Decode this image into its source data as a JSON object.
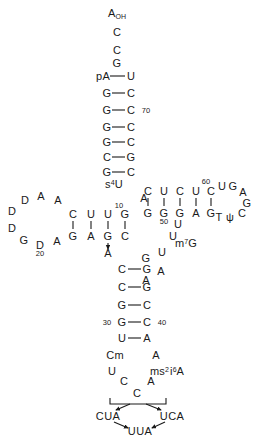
{
  "diagram": {
    "ink_color": "#1a1a1a",
    "background": "#ffffff"
  },
  "acceptor_stem": {
    "three_prime_end": {
      "label": "A",
      "sub": "OH",
      "x": 117,
      "y": 14
    },
    "five_prime_end": {
      "label": "pA",
      "x": 103,
      "y": 76
    },
    "single_strand_3p": [
      {
        "label": "C",
        "x": 117,
        "y": 32
      },
      {
        "label": "C",
        "x": 117,
        "y": 50
      },
      {
        "label": "G",
        "x": 117,
        "y": 63
      }
    ],
    "pairs": [
      {
        "left": "pA",
        "right": "U",
        "lx": 103,
        "rx": 131,
        "y": 76,
        "number": null
      },
      {
        "left": "G",
        "right": "C",
        "lx": 107,
        "rx": 131,
        "y": 93,
        "number": null
      },
      {
        "left": "G",
        "right": "C",
        "lx": 107,
        "rx": 131,
        "y": 110,
        "number": "70",
        "num_x": 146,
        "num_y": 111
      },
      {
        "left": "G",
        "right": "C",
        "lx": 107,
        "rx": 131,
        "y": 127,
        "number": null
      },
      {
        "left": "G",
        "right": "C",
        "lx": 107,
        "rx": 131,
        "y": 142,
        "number": null
      },
      {
        "left": "C",
        "right": "G",
        "lx": 107,
        "rx": 131,
        "y": 157,
        "number": null
      },
      {
        "left": "G",
        "right": "C",
        "lx": 107,
        "rx": 131,
        "y": 172,
        "number": null
      }
    ]
  },
  "t_arm": {
    "top_strand": [
      {
        "label": "C",
        "x": 148,
        "y": 191
      },
      {
        "label": "U",
        "x": 164,
        "y": 191
      },
      {
        "label": "C",
        "x": 180,
        "y": 191
      },
      {
        "label": "U",
        "x": 196,
        "y": 191
      },
      {
        "label": "C",
        "x": 211,
        "y": 191,
        "number": "60",
        "num_x": 206,
        "num_y": 182
      }
    ],
    "bottom_strand": [
      {
        "label": "G",
        "x": 148,
        "y": 213
      },
      {
        "label": "G",
        "x": 164,
        "y": 213,
        "number": "50",
        "num_x": 164,
        "num_y": 222
      },
      {
        "label": "G",
        "x": 180,
        "y": 213
      },
      {
        "label": "A",
        "x": 196,
        "y": 213
      },
      {
        "label": "G",
        "x": 211,
        "y": 213
      }
    ],
    "loop": [
      {
        "label": "U",
        "x": 222,
        "y": 186
      },
      {
        "label": "G",
        "x": 233,
        "y": 186
      },
      {
        "label": "A",
        "x": 243,
        "y": 192
      },
      {
        "label": "G",
        "x": 247,
        "y": 203
      },
      {
        "label": "C",
        "x": 242,
        "y": 213
      },
      {
        "label": "ψ",
        "x": 230,
        "y": 217
      },
      {
        "label": "T",
        "x": 219,
        "y": 217
      }
    ]
  },
  "d_arm": {
    "top_strand": [
      {
        "label": "C",
        "x": 73,
        "y": 214
      },
      {
        "label": "U",
        "x": 91,
        "y": 214
      },
      {
        "label": "U",
        "x": 108,
        "y": 214
      },
      {
        "label": "G",
        "x": 125,
        "y": 214,
        "number": "10",
        "num_x": 119,
        "num_y": 206
      }
    ],
    "bottom_strand": [
      {
        "label": "G",
        "x": 73,
        "y": 236
      },
      {
        "label": "A",
        "x": 91,
        "y": 236
      },
      {
        "label": "G",
        "x": 108,
        "y": 236
      },
      {
        "label": "C",
        "x": 125,
        "y": 236
      }
    ],
    "loop": [
      {
        "label": "A",
        "x": 58,
        "y": 200
      },
      {
        "label": "A",
        "x": 41,
        "y": 196
      },
      {
        "label": "D",
        "x": 25,
        "y": 200
      },
      {
        "label": "D",
        "x": 12,
        "y": 211
      },
      {
        "label": "D",
        "x": 12,
        "y": 228
      },
      {
        "label": "G",
        "x": 24,
        "y": 240
      },
      {
        "label": "D",
        "x": 40,
        "y": 245,
        "number": "20",
        "num_x": 40,
        "num_y": 254
      },
      {
        "label": "A",
        "x": 57,
        "y": 241
      }
    ]
  },
  "modified_bases": [
    {
      "label": "s",
      "sup": "4",
      "tail": "U",
      "x": 114,
      "y": 184,
      "name": "s4U"
    },
    {
      "label": "A",
      "x": 108,
      "y": 253,
      "name": "A-bulge"
    }
  ],
  "variable_loop": [
    {
      "label": "A",
      "x": 144,
      "y": 198
    },
    {
      "label": "U",
      "x": 178,
      "y": 224
    },
    {
      "label": "U",
      "x": 173,
      "y": 236
    },
    {
      "label": "m",
      "sup": "7",
      "tail": "G",
      "x": 184,
      "y": 243,
      "name": "m7G"
    },
    {
      "label": "U",
      "x": 162,
      "y": 252
    },
    {
      "label": "G",
      "x": 146,
      "y": 258
    },
    {
      "label": "A",
      "x": 161,
      "y": 271
    },
    {
      "label": "A",
      "x": 146,
      "y": 280
    }
  ],
  "anticodon_stem": {
    "pairs": [
      {
        "left": "C",
        "right": "G",
        "lx": 122,
        "rx": 147,
        "y": 269
      },
      {
        "left": "C",
        "right": "G",
        "lx": 122,
        "rx": 147,
        "y": 287
      },
      {
        "left": "G",
        "right": "C",
        "lx": 122,
        "rx": 147,
        "y": 305
      },
      {
        "left": "G",
        "right": "C",
        "lx": 122,
        "rx": 147,
        "y": 322,
        "left_number": "30",
        "ln_x": 107,
        "ln_y": 323,
        "right_number": "40",
        "rn_x": 162,
        "rn_y": 323
      },
      {
        "left": "U",
        "right": "A",
        "lx": 122,
        "rx": 147,
        "y": 338
      }
    ]
  },
  "anticodon_loop": {
    "left": [
      {
        "label": "Cm",
        "x": 115,
        "y": 355,
        "name": "Cm"
      },
      {
        "label": "U",
        "x": 112,
        "y": 371
      },
      {
        "label": "C",
        "x": 124,
        "y": 381
      }
    ],
    "right": [
      {
        "label": "A",
        "x": 156,
        "y": 355
      },
      {
        "label": "ms",
        "sup": "2",
        "mid": "i",
        "sup2": "6",
        "tail": "A",
        "x": 167,
        "y": 371,
        "name": "ms2i6A"
      },
      {
        "label": "A",
        "x": 151,
        "y": 381
      }
    ],
    "center": {
      "label": "C",
      "x": 137,
      "y": 393
    }
  },
  "codon_recognition": {
    "bracket_label": "anticodon-bracket",
    "codons": [
      {
        "label": "CUA",
        "x": 108,
        "y": 416,
        "name": "codon-cua"
      },
      {
        "label": "UCA",
        "x": 172,
        "y": 416,
        "name": "codon-uca"
      },
      {
        "label": "UUA",
        "x": 140,
        "y": 431,
        "name": "codon-uua"
      }
    ]
  }
}
